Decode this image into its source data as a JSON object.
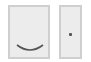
{
  "panels": [
    {
      "name": "left-panel",
      "mark": "smile-arc-icon",
      "fill": "#ececec",
      "border": "#cfcfcf"
    },
    {
      "name": "right-panel",
      "mark": "dot-icon",
      "fill": "#ececec",
      "border": "#cfcfcf"
    }
  ],
  "colors": {
    "mark": "#555555"
  }
}
